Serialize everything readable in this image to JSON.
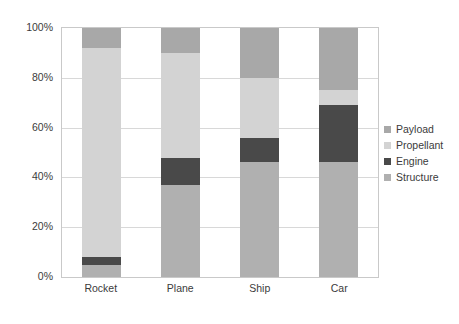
{
  "chart_data": {
    "type": "bar",
    "stacked": true,
    "stack_mode": "percent",
    "title": "",
    "subtitle": "",
    "xlabel": "",
    "ylabel": "",
    "categories": [
      "Rocket",
      "Plane",
      "Ship",
      "Car"
    ],
    "ytick_labels": [
      "100%",
      "80%",
      "60%",
      "40%",
      "20%",
      "0%"
    ],
    "ytick_values": [
      100,
      80,
      60,
      40,
      20,
      0
    ],
    "ylim": [
      0,
      100
    ],
    "grid": true,
    "grid_axis": "y",
    "legend_position": "right",
    "series": [
      {
        "name": "Payload",
        "color": "#a8a8a8",
        "values": [
          8,
          10,
          20,
          25
        ]
      },
      {
        "name": "Propellant",
        "color": "#d3d3d3",
        "values": [
          84,
          42,
          24,
          6
        ]
      },
      {
        "name": "Engine",
        "color": "#494949",
        "values": [
          3,
          11,
          10,
          23
        ]
      },
      {
        "name": "Structure",
        "color": "#b0b0b0",
        "values": [
          5,
          37,
          46,
          46
        ]
      }
    ],
    "stack_order_bottom_to_top": [
      "Structure",
      "Engine",
      "Propellant",
      "Payload"
    ]
  },
  "legend": {
    "items": [
      {
        "label": "Payload",
        "color": "#a8a8a8"
      },
      {
        "label": "Propellant",
        "color": "#d3d3d3"
      },
      {
        "label": "Engine",
        "color": "#494949"
      },
      {
        "label": "Structure",
        "color": "#b0b0b0"
      }
    ]
  },
  "colors": {
    "payload": "#a8a8a8",
    "propellant": "#d3d3d3",
    "engine": "#494949",
    "structure": "#b0b0b0",
    "gridline": "#d8d8d8",
    "axis_text": "#3b3b3b",
    "plot_border": "#c9c9c9",
    "background": "#ffffff"
  }
}
